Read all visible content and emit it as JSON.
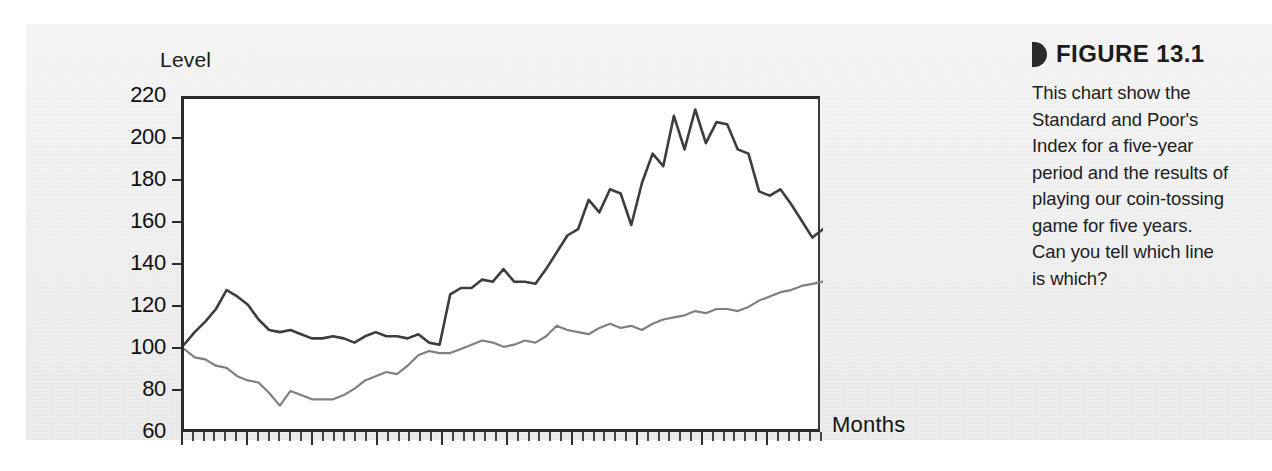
{
  "figure": {
    "marker_icon": "half-disc-marker-icon",
    "label": "FIGURE 13.1",
    "caption": "This chart show the Standard and Poor's Index for a five-year period and the results of playing our coin-tossing game for five years. Can you tell which line is which?"
  },
  "chart_data": {
    "type": "line",
    "title": "",
    "xlabel": "Months",
    "ylabel": "Level",
    "ylim": [
      60,
      220
    ],
    "yticks": [
      60,
      80,
      100,
      120,
      140,
      160,
      180,
      200,
      220
    ],
    "xlim": [
      0,
      60
    ],
    "xtick_count": 60,
    "xtick_labels": [],
    "grid": false,
    "legend": "none",
    "series": [
      {
        "name": "series-dark",
        "color": "#3d3d3d",
        "values": [
          103,
          109,
          114,
          120,
          129,
          126,
          122,
          115,
          110,
          109,
          110,
          108,
          106,
          106,
          107,
          106,
          104,
          107,
          109,
          107,
          107,
          106,
          108,
          104,
          103,
          127,
          130,
          130,
          134,
          133,
          139,
          133,
          133,
          132,
          139,
          147,
          155,
          158,
          172,
          166,
          177,
          175,
          160,
          180,
          194,
          188,
          212,
          196,
          215,
          199,
          209,
          208,
          196,
          194,
          176,
          174,
          177,
          170,
          162,
          154,
          158
        ]
      },
      {
        "name": "series-gray",
        "color": "#7f7f7f",
        "values": [
          101,
          97,
          96,
          93,
          92,
          88,
          86,
          85,
          80,
          74,
          81,
          79,
          77,
          77,
          77,
          79,
          82,
          86,
          88,
          90,
          89,
          93,
          98,
          100,
          99,
          99,
          101,
          103,
          105,
          104,
          102,
          103,
          105,
          104,
          107,
          112,
          110,
          109,
          108,
          111,
          113,
          111,
          112,
          110,
          113,
          115,
          116,
          117,
          119,
          118,
          120,
          120,
          119,
          121,
          124,
          126,
          128,
          129,
          131,
          132,
          133
        ]
      }
    ]
  }
}
